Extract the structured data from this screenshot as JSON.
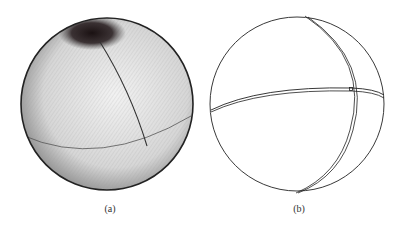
{
  "figure": {
    "panels": [
      {
        "id": "a",
        "caption": "(a)",
        "description": "shaded sphere with dense parallel curves and dark polar region, two great-circle arcs"
      },
      {
        "id": "b",
        "caption": "(b)",
        "description": "outline sphere with two doubled great-circle arcs crossing near right side"
      }
    ],
    "colors": {
      "ink": "#222222",
      "shade_dark": "#1a1112",
      "background": "#ffffff"
    }
  }
}
